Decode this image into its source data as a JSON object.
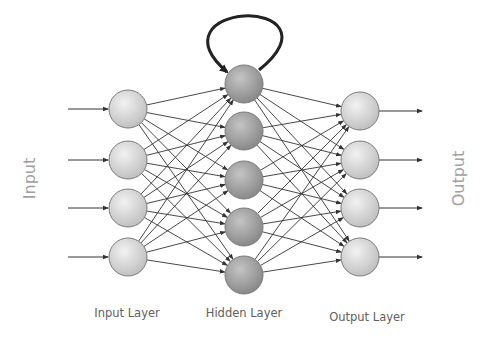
{
  "diagram": {
    "side_labels": {
      "input": "Input",
      "output": "Output"
    },
    "layer_labels": {
      "input": "Input Layer",
      "hidden": "Hidden Layer",
      "output": "Output Layer"
    },
    "layers": [
      {
        "name": "input",
        "x": 128,
        "nodes_y": [
          109,
          160,
          208,
          257
        ],
        "fill": "#d6d6d6"
      },
      {
        "name": "hidden",
        "x": 244,
        "nodes_y": [
          84,
          131,
          180,
          227,
          275
        ],
        "fill": "#a4a4a4"
      },
      {
        "name": "output",
        "x": 360,
        "nodes_y": [
          111,
          160,
          208,
          257
        ],
        "fill": "#d6d6d6"
      }
    ],
    "node_radius": 19,
    "connections": "fully-connected",
    "recurrent_loop": {
      "on_layer": "hidden",
      "node_index": 0
    },
    "colors": {
      "edge": "#333333",
      "loop": "#222222",
      "node_stroke": "#7a7a7a"
    }
  }
}
